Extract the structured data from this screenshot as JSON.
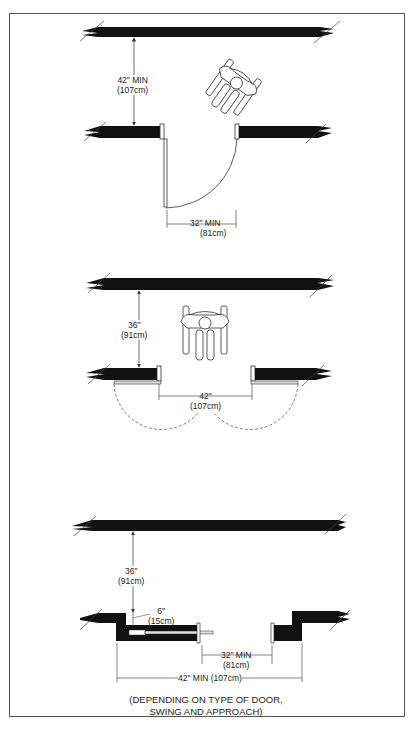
{
  "diagram": {
    "sections": [
      {
        "name": "single-door-diagonal-approach",
        "labels": {
          "corridor_depth": "42\" MIN",
          "corridor_depth_metric": "(107cm)",
          "door_clear_width": "32\" MIN",
          "door_clear_width_metric": "(81cm)"
        }
      },
      {
        "name": "double-door-front-approach",
        "labels": {
          "corridor_depth": "36\"",
          "corridor_depth_metric": "(91cm)",
          "door_clear_width": "42\"",
          "door_clear_width_metric": "(107cm)"
        }
      },
      {
        "name": "sliding-door-approach",
        "labels": {
          "corridor_depth": "36\"",
          "corridor_depth_metric": "(91cm)",
          "wall_offset": "6\"",
          "wall_offset_metric": "(15cm)",
          "door_clear_width": "32\" MIN",
          "door_clear_width_metric": "(81cm)",
          "overall_width": "42\" MIN (107cm)"
        }
      }
    ],
    "note_line1": "(DEPENDING ON TYPE OF DOOR,",
    "note_line2": "SWING AND APPROACH)",
    "colors": {
      "wall": "#111111",
      "line": "#333333",
      "frame": "#555555"
    }
  }
}
